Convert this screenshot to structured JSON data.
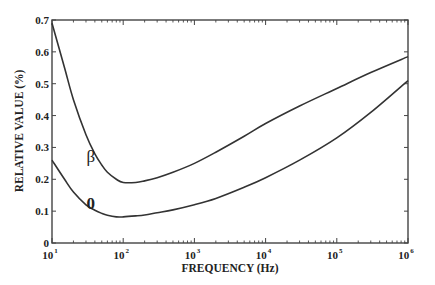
{
  "chart_data": {
    "type": "line",
    "title": "",
    "xlabel": "FREQUENCY (Hz)",
    "ylabel": "RELATIVE VALUE (%)",
    "xscale": "log",
    "xlim": [
      10,
      1000000
    ],
    "ylim": [
      0,
      0.7
    ],
    "grid": false,
    "legend": "inline curve labels",
    "x_ticks": [
      {
        "base": "10",
        "exp": "1",
        "value": 10
      },
      {
        "base": "10",
        "exp": "2",
        "value": 100
      },
      {
        "base": "10",
        "exp": "3",
        "value": 1000
      },
      {
        "base": "10",
        "exp": "4",
        "value": 10000
      },
      {
        "base": "10",
        "exp": "5",
        "value": 100000
      },
      {
        "base": "10",
        "exp": "6",
        "value": 1000000
      }
    ],
    "y_ticks": [
      "0",
      "0.1",
      "0.2",
      "0.3",
      "0.4",
      "0.5",
      "0.6",
      "0.7"
    ],
    "series": [
      {
        "name": "β",
        "label_pos": {
          "x": 35,
          "y": 0.255
        },
        "x": [
          10,
          15,
          20,
          30,
          40,
          50,
          60,
          80,
          100,
          150,
          200,
          300,
          500,
          1000,
          2000,
          5000,
          10000,
          30000,
          100000,
          300000,
          1000000
        ],
        "values": [
          0.69,
          0.55,
          0.45,
          0.34,
          0.28,
          0.245,
          0.222,
          0.2,
          0.19,
          0.19,
          0.195,
          0.205,
          0.222,
          0.25,
          0.285,
          0.335,
          0.375,
          0.43,
          0.485,
          0.535,
          0.585
        ]
      },
      {
        "name": "0",
        "label_pos": {
          "x": 35,
          "y": 0.108
        },
        "x": [
          10,
          15,
          20,
          30,
          40,
          50,
          60,
          80,
          100,
          150,
          200,
          300,
          500,
          1000,
          2000,
          5000,
          10000,
          30000,
          100000,
          300000,
          1000000
        ],
        "values": [
          0.26,
          0.2,
          0.16,
          0.12,
          0.103,
          0.093,
          0.087,
          0.082,
          0.082,
          0.085,
          0.088,
          0.095,
          0.104,
          0.12,
          0.14,
          0.175,
          0.205,
          0.26,
          0.33,
          0.41,
          0.51
        ]
      }
    ]
  },
  "axes": {
    "xlabel": "FREQUENCY (Hz)",
    "ylabel": "RELATIVE VALUE (%)"
  },
  "colors": {
    "frame": "#444444",
    "curve": "#333333",
    "text": "#222222"
  }
}
